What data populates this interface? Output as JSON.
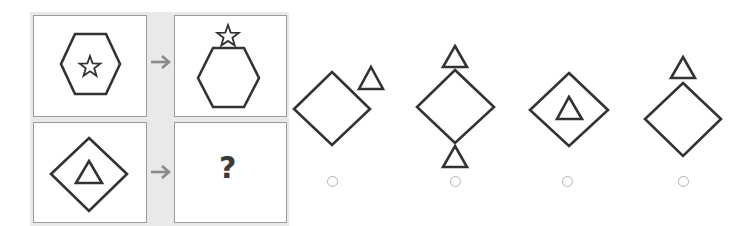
{
  "puzzle": {
    "question_mark": "?",
    "stroke_color": "#333333",
    "arrow_color": "#8a8a8a",
    "panel_color": "#e9e9e9",
    "cells": [
      {
        "id": "example-source",
        "shapes": [
          "hexagon",
          "star-inside"
        ]
      },
      {
        "id": "example-result",
        "shapes": [
          "hexagon",
          "star-on-top"
        ]
      },
      {
        "id": "query-source",
        "shapes": [
          "diamond",
          "triangle-inside"
        ]
      },
      {
        "id": "query-result",
        "shapes": [
          "unknown"
        ]
      }
    ]
  },
  "options": [
    {
      "label": "A",
      "description": "diamond with triangle at upper-right",
      "selected": false
    },
    {
      "label": "B",
      "description": "diamond with triangles above and below",
      "selected": false
    },
    {
      "label": "C",
      "description": "diamond with triangle inside",
      "selected": false
    },
    {
      "label": "D",
      "description": "diamond with triangle on top",
      "selected": false
    }
  ]
}
